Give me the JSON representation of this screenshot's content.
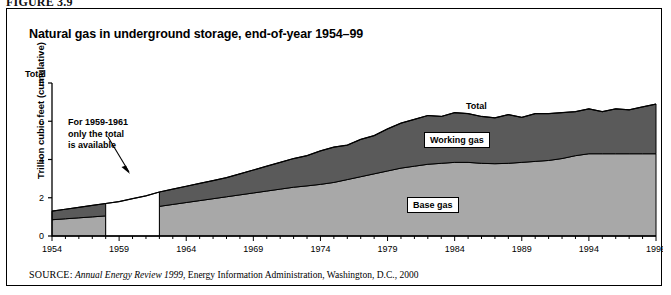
{
  "figure": {
    "header": "FIGURE 3.9",
    "title": "Natural gas in underground storage, end-of-year 1954–99"
  },
  "source": {
    "key": "SOURCE:",
    "title": "Annual Energy Review 1999",
    "rest": ", Energy Information Administration, Washington, D.C., 2000"
  },
  "annotation": {
    "line1": "For 1959-1961",
    "line2": "only the total",
    "line3": "is available"
  },
  "labels": {
    "total": "Total",
    "working_gas": "Working gas",
    "base_gas": "Base gas",
    "y_axis_cap": "Total"
  },
  "colors": {
    "working_gas": "#5a5a5a",
    "base_gas": "#a8a8a8",
    "gap": "#ffffff",
    "axis": "#000000",
    "frame": "#000000"
  },
  "chart_data": {
    "type": "area",
    "title": "Natural gas in underground storage, end-of-year 1954–99",
    "xlabel": "",
    "ylabel": "Trillion cubic feet (cumulative)",
    "xlim": [
      1954,
      1999
    ],
    "ylim": [
      0,
      8
    ],
    "yticks": [
      0,
      2,
      4,
      6,
      8
    ],
    "xticks": [
      1954,
      1959,
      1964,
      1969,
      1974,
      1979,
      1984,
      1989,
      1994,
      1999
    ],
    "grid": false,
    "legend": "in-plot labels",
    "stacked": true,
    "note": "Base gas and working gas split unavailable for 1959-1961; only the total is shown (white gap).",
    "gap_years": [
      1959,
      1960,
      1961
    ],
    "x": [
      1954,
      1955,
      1956,
      1957,
      1958,
      1959,
      1960,
      1961,
      1962,
      1963,
      1964,
      1965,
      1966,
      1967,
      1968,
      1969,
      1970,
      1971,
      1972,
      1973,
      1974,
      1975,
      1976,
      1977,
      1978,
      1979,
      1980,
      1981,
      1982,
      1983,
      1984,
      1985,
      1986,
      1987,
      1988,
      1989,
      1990,
      1991,
      1992,
      1993,
      1994,
      1995,
      1996,
      1997,
      1998,
      1999
    ],
    "series": [
      {
        "name": "Base gas",
        "color": "#a8a8a8",
        "values": [
          0.85,
          0.9,
          0.95,
          1.0,
          1.05,
          null,
          null,
          null,
          1.55,
          1.65,
          1.75,
          1.85,
          1.95,
          2.05,
          2.15,
          2.25,
          2.35,
          2.45,
          2.55,
          2.62,
          2.7,
          2.8,
          2.95,
          3.1,
          3.25,
          3.4,
          3.55,
          3.65,
          3.75,
          3.8,
          3.85,
          3.85,
          3.8,
          3.78,
          3.8,
          3.85,
          3.9,
          3.95,
          4.05,
          4.2,
          4.3,
          4.3,
          4.3,
          4.3,
          4.3,
          4.3
        ]
      },
      {
        "name": "Working gas",
        "color": "#5a5a5a",
        "values": [
          0.45,
          0.5,
          0.55,
          0.6,
          0.65,
          null,
          null,
          null,
          0.75,
          0.8,
          0.85,
          0.9,
          0.95,
          1.0,
          1.1,
          1.2,
          1.3,
          1.4,
          1.5,
          1.58,
          1.75,
          1.85,
          1.8,
          1.95,
          2.0,
          2.2,
          2.35,
          2.45,
          2.55,
          2.45,
          2.6,
          2.55,
          2.45,
          2.4,
          2.55,
          2.35,
          2.5,
          2.45,
          2.4,
          2.3,
          2.35,
          2.2,
          2.35,
          2.3,
          2.45,
          2.6
        ]
      }
    ],
    "total": {
      "name": "Total",
      "values": [
        1.3,
        1.4,
        1.5,
        1.6,
        1.7,
        1.8,
        1.95,
        2.1,
        2.3,
        2.45,
        2.6,
        2.75,
        2.9,
        3.05,
        3.25,
        3.45,
        3.65,
        3.85,
        4.05,
        4.2,
        4.45,
        4.65,
        4.75,
        5.05,
        5.25,
        5.6,
        5.9,
        6.1,
        6.3,
        6.25,
        6.45,
        6.4,
        6.25,
        6.18,
        6.35,
        6.2,
        6.4,
        6.4,
        6.45,
        6.5,
        6.65,
        6.5,
        6.65,
        6.6,
        6.75,
        6.9
      ]
    }
  }
}
